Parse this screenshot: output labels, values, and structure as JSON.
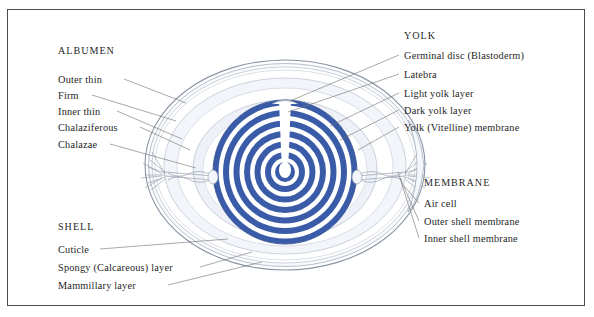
{
  "diagram": {
    "colors": {
      "yolk_blue": "#3a5ca8",
      "yolk_blue_dark": "#2f4c8e",
      "shell_line": "#7e8a9c",
      "albumen_tint": "#eef1f6",
      "leader_line": "#6f6f6f",
      "frame": "#4a4a4a",
      "text": "#1f1f1f"
    },
    "groups": [
      {
        "id": "albumen",
        "heading": "ALBUMEN",
        "heading_pos": {
          "x": 58,
          "y": 52
        },
        "labels": [
          {
            "text": "Outer thin",
            "x": 58,
            "y": 82
          },
          {
            "text": "Firm",
            "x": 58,
            "y": 98
          },
          {
            "text": "Inner thin",
            "x": 58,
            "y": 114
          },
          {
            "text": "Chalaziferous",
            "x": 58,
            "y": 130
          },
          {
            "text": "Chalazae",
            "x": 58,
            "y": 147
          }
        ]
      },
      {
        "id": "shell",
        "heading": "SHELL",
        "heading_pos": {
          "x": 58,
          "y": 228
        },
        "labels": [
          {
            "text": "Cuticle",
            "x": 58,
            "y": 252
          },
          {
            "text": "Spongy (Calcareous) layer",
            "x": 58,
            "y": 270
          },
          {
            "text": "Mammillary layer",
            "x": 58,
            "y": 288
          }
        ]
      },
      {
        "id": "yolk",
        "heading": "YOLK",
        "heading_pos": {
          "x": 404,
          "y": 37
        },
        "labels": [
          {
            "text": "Germinal disc (Blastoderm)",
            "x": 404,
            "y": 58
          },
          {
            "text": "Latebra",
            "x": 404,
            "y": 77
          },
          {
            "text": "Light yolk layer",
            "x": 404,
            "y": 96
          },
          {
            "text": "Dark yolk layer",
            "x": 404,
            "y": 113
          },
          {
            "text": "Yolk (Vitelline) membrane",
            "x": 404,
            "y": 130
          }
        ]
      },
      {
        "id": "membrane",
        "heading": "MEMBRANE",
        "heading_pos": {
          "x": 424,
          "y": 184
        },
        "labels": [
          {
            "text": "Air cell",
            "x": 424,
            "y": 206
          },
          {
            "text": "Outer shell membrane",
            "x": 424,
            "y": 224
          },
          {
            "text": "Inner shell membrane",
            "x": 424,
            "y": 241
          }
        ]
      }
    ],
    "yolk": {
      "center": {
        "x": 285,
        "y": 172
      },
      "ring_count": 8,
      "outer_radius": 72
    }
  }
}
